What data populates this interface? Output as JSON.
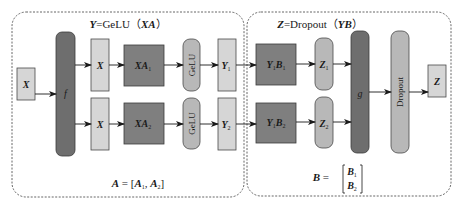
{
  "colors": {
    "light_box": "#d6d6d6",
    "mid_box": "#7f7f7f",
    "dark_bar": "#6e6e6e",
    "pill": "#b8b8b8",
    "border": "#4a4a4a",
    "dashed": "#555555"
  },
  "left_panel": {
    "title_var": "Y",
    "title_eq": "=GeLU（",
    "title_arg": "XA",
    "title_close": "）",
    "footer_lhs": "A",
    "footer_eq": " = [",
    "footer_a1": "A",
    "footer_a1_sub": "1",
    "footer_comma": ", ",
    "footer_a2": "A",
    "footer_a2_sub": "2",
    "footer_close": "]"
  },
  "right_panel": {
    "title_var": "Z",
    "title_eq": "=Dropout（",
    "title_arg": "YB",
    "title_close": "）",
    "footer_lhs": "B",
    "footer_eq": " = ",
    "footer_b1": "B",
    "footer_b1_sub": "1",
    "footer_b2": "B",
    "footer_b2_sub": "2"
  },
  "nodes": {
    "input_x": "X",
    "split_f": "f",
    "x_top": "X",
    "x_bottom": "X",
    "xa1": "XA",
    "xa1_sub": "1",
    "xa2": "XA",
    "xa2_sub": "2",
    "gelu_top": "GeLU",
    "gelu_bottom": "GeLU",
    "y1": "Y",
    "y1_sub": "1",
    "y2": "Y",
    "y2_sub": "2",
    "y1b1_y": "Y",
    "y1b1_ysub": "1",
    "y1b1_b": "B",
    "y1b1_bsub": "1",
    "y1b2_y": "Y",
    "y1b2_ysub": "1",
    "y1b2_b": "B",
    "y1b2_bsub": "2",
    "z1": "Z",
    "z1_sub": "1",
    "z2": "Z",
    "z2_sub": "2",
    "merge_g": "g",
    "dropout": "Dropout",
    "output_z": "Z"
  }
}
